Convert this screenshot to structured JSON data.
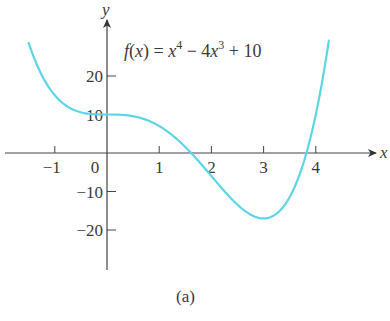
{
  "chart_data": {
    "type": "line",
    "caption": "(a)",
    "xlabel": "x",
    "ylabel": "y",
    "xlim": [
      -1.6,
      4.9
    ],
    "ylim": [
      -31,
      37
    ],
    "grid": false,
    "x_ticks": [
      -1,
      0,
      1,
      2,
      3,
      4
    ],
    "x_tick_labels": [
      "−1",
      "0",
      "1",
      "2",
      "3",
      "4"
    ],
    "y_ticks": [
      20,
      10,
      -10,
      -20
    ],
    "y_tick_labels": [
      "20",
      "10",
      "−10",
      "−20"
    ],
    "series": [
      {
        "name": "f(x) = x^4 − 4x^3 + 10",
        "color": "#5cd6e6",
        "x": [
          -1.5,
          -1.0,
          -0.5,
          0,
          0.5,
          1.0,
          1.5,
          2.0,
          2.5,
          3.0,
          3.5,
          4.0,
          4.25
        ],
        "values": [
          28.56,
          15,
          10.56,
          10,
          9.56,
          7,
          1.56,
          -6,
          -13.44,
          -17,
          -11.44,
          10,
          24.82
        ]
      }
    ]
  },
  "labels": {
    "eq_f": "f",
    "eq_paren_open": "(",
    "eq_x": "x",
    "eq_paren_close": ")",
    "eq_equals": " = ",
    "eq_x1": "x",
    "eq_exp4": "4",
    "eq_minus": " − 4",
    "eq_x2": "x",
    "eq_exp3": "3",
    "eq_plus": " + 10"
  }
}
